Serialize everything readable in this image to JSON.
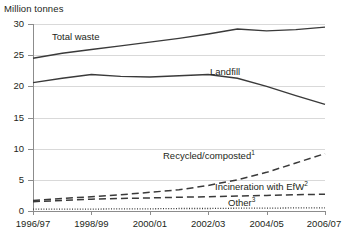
{
  "chart_data": {
    "type": "line",
    "title": "",
    "ylabel": "Million tonnes",
    "xlabel": "",
    "ylim": [
      0,
      30
    ],
    "yticks": [
      0,
      5,
      10,
      15,
      20,
      25,
      30
    ],
    "grid": true,
    "legend_position": "inline-labels",
    "x": [
      "1996/97",
      "1997/98",
      "1998/99",
      "1999/00",
      "2000/01",
      "2001/02",
      "2002/03",
      "2003/04",
      "2004/05",
      "2005/06",
      "2006/07"
    ],
    "xtick_labels": [
      "1996/97",
      "1998/99",
      "2000/01",
      "2002/03",
      "2004/05",
      "2006/07"
    ],
    "series": [
      {
        "name": "Total waste",
        "style": "solid",
        "color": "#3a3a3a",
        "values": [
          24.5,
          25.3,
          25.9,
          26.5,
          27.1,
          27.7,
          28.4,
          29.2,
          28.9,
          29.1,
          29.5
        ]
      },
      {
        "name": "Landfill",
        "style": "solid",
        "color": "#3a3a3a",
        "footnote": "",
        "values": [
          20.6,
          21.3,
          21.9,
          21.6,
          21.5,
          21.7,
          21.9,
          21.3,
          20.0,
          18.5,
          17.1
        ]
      },
      {
        "name": "Recycled/composted",
        "style": "dashed",
        "color": "#3a3a3a",
        "footnote": "1",
        "values": [
          1.7,
          2.0,
          2.3,
          2.6,
          3.0,
          3.4,
          4.1,
          5.0,
          6.2,
          7.7,
          9.2
        ]
      },
      {
        "name": "Incineration with EfW",
        "style": "dashed",
        "color": "#3a3a3a",
        "footnote": "2",
        "values": [
          1.5,
          1.7,
          1.9,
          2.0,
          2.1,
          2.2,
          2.3,
          2.4,
          2.5,
          2.6,
          2.7
        ]
      },
      {
        "name": "Other",
        "style": "dotted",
        "color": "#3a3a3a",
        "footnote": "3",
        "values": [
          0.3,
          0.3,
          0.3,
          0.35,
          0.35,
          0.4,
          0.4,
          0.45,
          0.45,
          0.5,
          0.5
        ]
      }
    ]
  },
  "labels": {
    "total_waste": "Total waste",
    "landfill": "Landfill",
    "recycled": "Recycled/composted",
    "recycled_sup": "1",
    "incineration": "Incineration with EfW",
    "incineration_sup": "2",
    "other": "Other",
    "other_sup": "3"
  }
}
